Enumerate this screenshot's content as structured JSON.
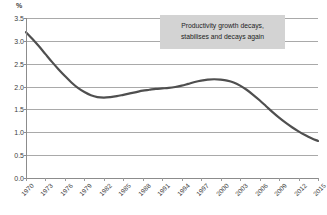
{
  "chart_data": {
    "type": "line",
    "title": "",
    "subtitle": "",
    "xlabel": "",
    "ylabel": "%",
    "y_unit_label": "%",
    "grid": true,
    "legend": "none",
    "xlim": [
      1970,
      2015
    ],
    "ylim": [
      0.0,
      3.5
    ],
    "yticks": [
      "0.0",
      "0.5",
      "1.0",
      "1.5",
      "2.0",
      "2.5",
      "3.0",
      "3.5"
    ],
    "ytick_values": [
      0.0,
      0.5,
      1.0,
      1.5,
      2.0,
      2.5,
      3.0,
      3.5
    ],
    "xticks": [
      "1970",
      "1973",
      "1976",
      "1979",
      "1982",
      "1985",
      "1988",
      "1991",
      "1994",
      "1997",
      "2000",
      "2003",
      "2006",
      "2009",
      "2012",
      "2015"
    ],
    "xtick_values": [
      1970,
      1973,
      1976,
      1979,
      1982,
      1985,
      1988,
      1991,
      1994,
      1997,
      2000,
      2003,
      2006,
      2009,
      2012,
      2015
    ],
    "series": [
      {
        "name": "Productivity growth",
        "color": "#4f4f4f",
        "x": [
          1970,
          1971,
          1972,
          1973,
          1974,
          1975,
          1976,
          1977,
          1978,
          1979,
          1980,
          1981,
          1982,
          1983,
          1984,
          1985,
          1986,
          1987,
          1988,
          1989,
          1990,
          1991,
          1992,
          1993,
          1994,
          1995,
          1996,
          1997,
          1998,
          1999,
          2000,
          2001,
          2002,
          2003,
          2004,
          2005,
          2006,
          2007,
          2008,
          2009,
          2010,
          2011,
          2012,
          2013,
          2014,
          2015
        ],
        "y": [
          3.19,
          3.04,
          2.88,
          2.71,
          2.54,
          2.38,
          2.23,
          2.09,
          1.97,
          1.88,
          1.81,
          1.77,
          1.76,
          1.77,
          1.79,
          1.82,
          1.85,
          1.88,
          1.91,
          1.93,
          1.95,
          1.96,
          1.97,
          1.99,
          2.02,
          2.06,
          2.1,
          2.13,
          2.15,
          2.16,
          2.15,
          2.13,
          2.09,
          2.02,
          1.93,
          1.82,
          1.7,
          1.57,
          1.44,
          1.32,
          1.21,
          1.11,
          1.02,
          0.94,
          0.87,
          0.81
        ]
      }
    ],
    "annotations": [
      {
        "id": "annotation-callout",
        "line1": "Productivity growth decays,",
        "line2": "stabilises and decays again",
        "background": "#d3d3d3"
      }
    ],
    "colors": {
      "line": "#4f4f4f",
      "grid": "#a9a9a9",
      "axis": "#8c8c8c",
      "text": "#3d3d3d",
      "annotation_bg": "#d3d3d3",
      "background": "#ffffff"
    }
  }
}
